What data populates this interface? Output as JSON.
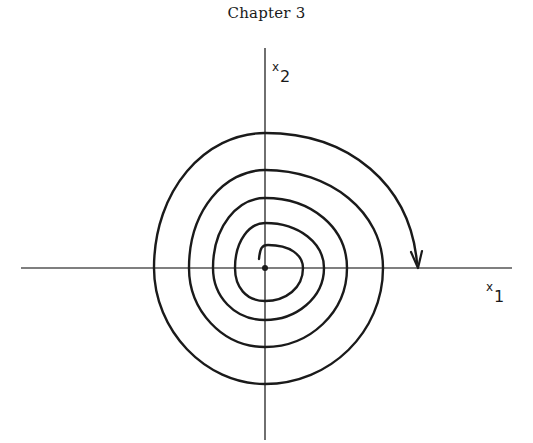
{
  "title": "Chapter 3",
  "figure": {
    "type": "phase-portrait",
    "axes": {
      "x": {
        "label_base": "x",
        "label_sub": "1"
      },
      "y": {
        "label_base": "x",
        "label_sub": "2"
      }
    },
    "origin_marker": "equilibrium-point",
    "direction": "clockwise, outward",
    "colors": {
      "stroke": "#1a1a1a",
      "background": "#ffffff"
    }
  }
}
